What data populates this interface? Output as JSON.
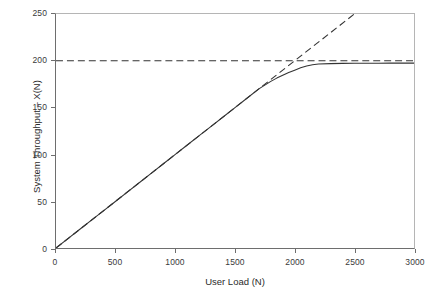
{
  "chart_data": {
    "type": "line",
    "title": "",
    "xlabel": "User Load (N)",
    "ylabel": "System Throughput – X(N)",
    "xlim": [
      0,
      3000
    ],
    "ylim": [
      0,
      250
    ],
    "xticks": [
      0,
      500,
      1000,
      1500,
      2000,
      2500,
      3000
    ],
    "yticks": [
      0,
      50,
      100,
      150,
      200,
      250
    ],
    "xtick_labels": [
      "0",
      "500",
      "1000",
      "1500",
      "2000",
      "2500",
      "3000"
    ],
    "ytick_labels": [
      "0",
      "50",
      "100",
      "150",
      "200",
      "250"
    ],
    "grid": false,
    "legend": "none",
    "series": [
      {
        "name": "System throughput X(N)",
        "style": "solid",
        "color": "#333333",
        "x": [
          0,
          100,
          200,
          300,
          400,
          500,
          600,
          700,
          800,
          900,
          1000,
          1100,
          1200,
          1300,
          1400,
          1500,
          1600,
          1700,
          1750,
          1800,
          1850,
          1900,
          1950,
          2000,
          2050,
          2100,
          2150,
          2200,
          2300,
          2400,
          2500,
          2600,
          2700,
          2800,
          2900,
          3000
        ],
        "y": [
          0,
          10,
          20,
          30,
          40,
          50,
          60,
          70,
          80,
          90,
          100,
          110,
          120,
          130,
          140,
          150,
          160,
          170,
          174,
          178,
          181.5,
          184.5,
          187.5,
          190,
          192.5,
          194.5,
          195.8,
          196.5,
          197,
          197.2,
          197.3,
          197.4,
          197.4,
          197.5,
          197.5,
          197.5
        ]
      },
      {
        "name": "Linear scalability asymptote",
        "style": "dashed",
        "color": "#333333",
        "x": [
          0,
          2500
        ],
        "y": [
          0,
          250
        ]
      },
      {
        "name": "Saturation asymptote",
        "style": "dashed",
        "color": "#333333",
        "x": [
          0,
          3000
        ],
        "y": [
          200,
          200
        ]
      }
    ],
    "annotations": []
  },
  "axes": {
    "x_title": "User Load (N)",
    "y_title": "System Throughput – X(N)"
  },
  "colors": {
    "line": "#333333",
    "axis_dark": "#6e6e6e",
    "axis_light": "#b5b5b5",
    "tick_text": "#3a3a3a",
    "background": "#ffffff"
  }
}
